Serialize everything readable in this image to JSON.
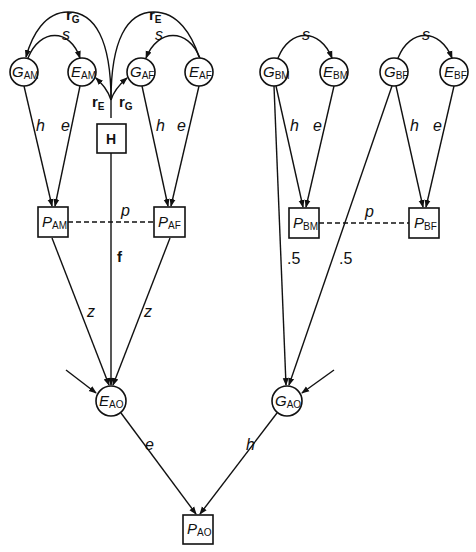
{
  "diagram": {
    "type": "path-diagram",
    "nodes": {
      "G_AM": {
        "main": "G",
        "sub": "AM",
        "shape": "circle"
      },
      "E_AM": {
        "main": "E",
        "sub": "AM",
        "shape": "circle"
      },
      "G_AF": {
        "main": "G",
        "sub": "AF",
        "shape": "circle"
      },
      "E_AF": {
        "main": "E",
        "sub": "AF",
        "shape": "circle"
      },
      "H": {
        "main": "H",
        "shape": "box"
      },
      "G_BM": {
        "main": "G",
        "sub": "BM",
        "shape": "circle"
      },
      "E_BM": {
        "main": "E",
        "sub": "BM",
        "shape": "circle"
      },
      "G_BF": {
        "main": "G",
        "sub": "BF",
        "shape": "circle"
      },
      "E_BF": {
        "main": "E",
        "sub": "BF",
        "shape": "circle"
      },
      "P_AM": {
        "main": "P",
        "sub": "AM",
        "shape": "box"
      },
      "P_AF": {
        "main": "P",
        "sub": "AF",
        "shape": "box"
      },
      "P_BM": {
        "main": "P",
        "sub": "BM",
        "shape": "box"
      },
      "P_BF": {
        "main": "P",
        "sub": "BF",
        "shape": "box"
      },
      "E_AO": {
        "main": "E",
        "sub": "AO",
        "shape": "circle"
      },
      "G_AO": {
        "main": "G",
        "sub": "AO",
        "shape": "circle"
      },
      "P_AO": {
        "main": "P",
        "sub": "AO",
        "shape": "box"
      }
    },
    "edge_labels": {
      "rG_top": {
        "main": "r",
        "sub": "G"
      },
      "rE_top": {
        "main": "r",
        "sub": "E"
      },
      "s_A_left": "s",
      "s_A_right": "s",
      "rE_H": {
        "main": "r",
        "sub": "E"
      },
      "rG_H": {
        "main": "r",
        "sub": "G"
      },
      "h_AM": "h",
      "e_AM": "e",
      "h_AF": "h",
      "e_AF": "e",
      "s_BM": "s",
      "s_BF": "s",
      "h_BM": "h",
      "e_BM": "e",
      "h_BF": "h",
      "e_BF": "e",
      "p_A": "p",
      "p_B": "p",
      "f": "f",
      "z_left": "z",
      "z_right": "z",
      "half_BM": ".5",
      "half_BF": ".5",
      "e_AO": "e",
      "h_AO": "h"
    }
  }
}
